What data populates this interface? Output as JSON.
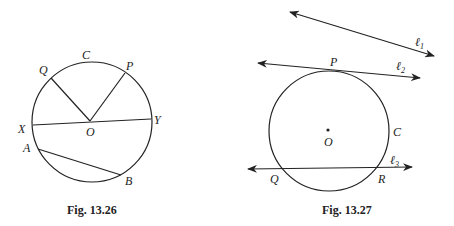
{
  "figures": [
    {
      "caption": "Fig. 13.26",
      "labels": {
        "C": "C",
        "Q": "Q",
        "P": "P",
        "X": "X",
        "O": "O",
        "Y": "Y",
        "A": "A",
        "B": "B"
      }
    },
    {
      "caption": "Fig. 13.27",
      "labels": {
        "P": "P",
        "O": "O",
        "C": "C",
        "Q": "Q",
        "R": "R",
        "l1": "ℓ",
        "l1_sub": "1",
        "l2": "ℓ",
        "l2_sub": "2",
        "l3": "ℓ",
        "l3_sub": "3"
      }
    }
  ]
}
